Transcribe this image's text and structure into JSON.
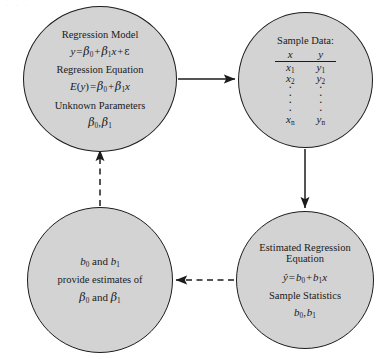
{
  "diagram": {
    "bleed_artifact": "· · ·",
    "colors": {
      "node_fill": "#d3d3d3",
      "node_stroke": "#1c1c1c",
      "connector": "#1c1c1c",
      "background": "#ffffff"
    }
  },
  "nodes": {
    "model": {
      "heading_1": "Regression Model",
      "equation_1_lhs": "y",
      "equation_1_eq": "=",
      "equation_1_b0": "β",
      "equation_1_b0_sub": "0",
      "equation_1_plus1": "+",
      "equation_1_b1": "β",
      "equation_1_b1_sub": "1",
      "equation_1_x": "x",
      "equation_1_plus2": "+",
      "equation_1_eps": "ε",
      "heading_2": "Regression Equation",
      "equation_2_lhs_e": "E",
      "equation_2_lhs_open": "(",
      "equation_2_lhs_y": "y",
      "equation_2_lhs_close": ")",
      "equation_2_eq": "=",
      "equation_2_b0": "β",
      "equation_2_b0_sub": "0",
      "equation_2_plus": "+",
      "equation_2_b1": "β",
      "equation_2_b1_sub": "1",
      "equation_2_x": "x",
      "heading_3": "Unknown Parameters",
      "params_b0": "β",
      "params_b0_sub": "0",
      "params_comma": ",",
      "params_b1": "β",
      "params_b1_sub": "1"
    },
    "sample": {
      "heading": "Sample Data:",
      "columns": [
        "x",
        "y"
      ],
      "rows": [
        {
          "x": "x",
          "x_sub": "1",
          "y": "y",
          "y_sub": "1"
        },
        {
          "x": "x",
          "x_sub": "2",
          "y": "y",
          "y_sub": "2"
        }
      ],
      "ellipsis": "·",
      "last_row": {
        "x": "x",
        "x_sub": "n",
        "y": "y",
        "y_sub": "n"
      }
    },
    "estimated": {
      "heading_line_1": "Estimated Regression",
      "heading_line_2": "Equation",
      "equation_yhat": "ŷ",
      "equation_eq": "=",
      "equation_b0": "b",
      "equation_b0_sub": "0",
      "equation_plus": "+",
      "equation_b1": "b",
      "equation_b1_sub": "1",
      "equation_x": "x",
      "heading_stats": "Sample Statistics",
      "stats_b0": "b",
      "stats_b0_sub": "0",
      "stats_comma": ",",
      "stats_b1": "b",
      "stats_b1_sub": "1"
    },
    "inference": {
      "line_1_b0": "b",
      "line_1_b0_sub": "0",
      "line_1_and": "and",
      "line_1_b1": "b",
      "line_1_b1_sub": "1",
      "line_2": "provide estimates of",
      "line_3_beta0": "β",
      "line_3_beta0_sub": "0",
      "line_3_and": "and",
      "line_3_beta1": "β",
      "line_3_beta1_sub": "1"
    }
  },
  "connectors": [
    {
      "id": "model-to-sample",
      "style": "solid",
      "direction": "right",
      "label": ""
    },
    {
      "id": "sample-to-estimated",
      "style": "solid",
      "direction": "down",
      "label": ""
    },
    {
      "id": "estimated-to-inference",
      "style": "dashed",
      "direction": "left",
      "label": ""
    },
    {
      "id": "inference-to-model",
      "style": "dashed",
      "direction": "up",
      "label": ""
    }
  ]
}
